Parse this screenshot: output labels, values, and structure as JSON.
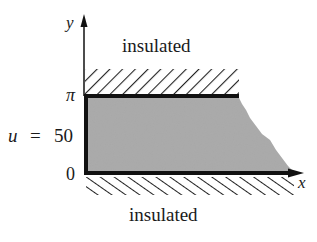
{
  "diagram": {
    "title": "",
    "axes": {
      "x_label": "x",
      "y_label": "y"
    },
    "y_ticks": [
      {
        "label": "π",
        "value": "pi"
      },
      {
        "label": "0",
        "value": "0"
      }
    ],
    "boundary_labels": {
      "top": "insulated",
      "bottom": "insulated",
      "left_condition": {
        "var": "u",
        "eq": "=",
        "value": "50"
      }
    },
    "region": {
      "description": "semi-infinite strip 0 ≤ y ≤ π, x ≥ 0 (shaded)",
      "fill_color": "#a8a8a8"
    },
    "colors": {
      "line": "#111111",
      "hatch": "#222222",
      "text": "#1a1a1a"
    }
  }
}
